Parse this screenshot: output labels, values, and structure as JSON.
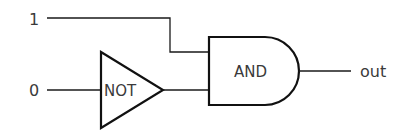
{
  "diagram": {
    "type": "logic-circuit",
    "inputs": [
      {
        "id": "in1",
        "label": "1"
      },
      {
        "id": "in0",
        "label": "0"
      }
    ],
    "gates": [
      {
        "id": "not_gate",
        "label": "NOT",
        "kind": "NOT",
        "inputs": [
          "in0"
        ]
      },
      {
        "id": "and_gate",
        "label": "AND",
        "kind": "AND",
        "inputs": [
          "in1",
          "not_gate"
        ]
      }
    ],
    "output": {
      "id": "out",
      "label": "out",
      "source": "and_gate"
    },
    "colors": {
      "stroke": "#111111",
      "text": "#3a3a3a",
      "background": "#ffffff"
    }
  }
}
